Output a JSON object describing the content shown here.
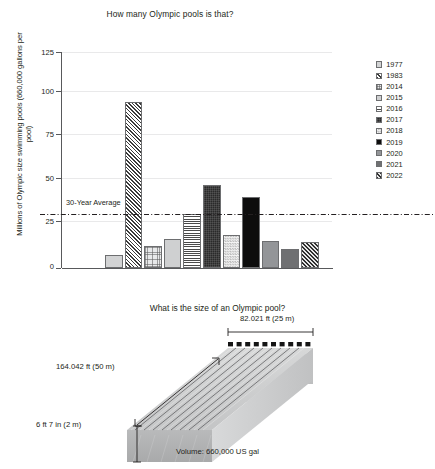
{
  "chart_data": {
    "type": "bar",
    "title": "How many Olympic pools is that?",
    "xlabel": "",
    "ylabel": "Millions of Olympic size swimming pools (660,000 gallons per pool)",
    "ylim": [
      0,
      125
    ],
    "yticks": [
      0,
      25,
      50,
      75,
      100,
      125
    ],
    "grid": true,
    "legend_position": "right",
    "categories": [
      "1977",
      "1983",
      "2014",
      "2015",
      "2016",
      "2017",
      "2018",
      "2019",
      "2020",
      "2021",
      "2022"
    ],
    "values": [
      7.5,
      96,
      13,
      17,
      31,
      48,
      19,
      41,
      15.5,
      11,
      15
    ],
    "series": [
      {
        "name": "Millions of Olympic size swimming pools",
        "values": [
          7.5,
          96,
          13,
          17,
          31,
          48,
          19,
          41,
          15.5,
          11,
          15
        ]
      }
    ],
    "bar_styles": [
      "fill-plain-light",
      "fill-diag-dense",
      "fill-grid-lt",
      "fill-speckle",
      "fill-solid-lt",
      "fill-horiz",
      "fill-dark-tex",
      "fill-check",
      "fill-black",
      "fill-gray-mid",
      "fill-gray-dark",
      "fill-diag-dark"
    ],
    "annotations": [
      {
        "name": "30-year-average-line",
        "label": "30-Year Average",
        "value": 31
      }
    ]
  },
  "chart": {
    "title": "How many Olympic pools is that?",
    "y_axis_title": "Millions of Olympic size swimming pools (660,000 gallons per pool)",
    "y_ticks": [
      "125",
      "100",
      "75",
      "50",
      "25",
      "0"
    ],
    "average_label": "30-Year Average",
    "bars": [
      {
        "year": "1977",
        "value": 7.5,
        "style": "fill-plain-light"
      },
      {
        "year": "1983",
        "value": 96,
        "style": "fill-diag-dense"
      },
      {
        "year": "2014",
        "value": 13,
        "style": "fill-grid-lt"
      },
      {
        "year": "2015",
        "value": 17,
        "style": "fill-solid-lt"
      },
      {
        "year": "2016",
        "value": 31,
        "style": "fill-horiz"
      },
      {
        "year": "2017",
        "value": 48,
        "style": "fill-dark-tex"
      },
      {
        "year": "2018",
        "value": 19,
        "style": "fill-check"
      },
      {
        "year": "2019",
        "value": 41,
        "style": "fill-black"
      },
      {
        "year": "2020",
        "value": 15.5,
        "style": "fill-gray-mid"
      },
      {
        "year": "2021",
        "value": 11,
        "style": "fill-gray-dark"
      },
      {
        "year": "2022",
        "value": 15,
        "style": "fill-diag-dark"
      }
    ],
    "legend": [
      {
        "label": "1977",
        "style": "fill-plain-light"
      },
      {
        "label": "1983",
        "style": "fill-diag-dense"
      },
      {
        "label": "2014",
        "style": "fill-grid-lt"
      },
      {
        "label": "2015",
        "style": "fill-solid-lt"
      },
      {
        "label": "2016",
        "style": "fill-horiz"
      },
      {
        "label": "2017",
        "style": "fill-dark-tex"
      },
      {
        "label": "2018",
        "style": "fill-check"
      },
      {
        "label": "2019",
        "style": "fill-black"
      },
      {
        "label": "2020",
        "style": "fill-gray-mid"
      },
      {
        "label": "2021",
        "style": "fill-gray-dark"
      },
      {
        "label": "2022",
        "style": "fill-diag-dark"
      }
    ]
  },
  "pool": {
    "title": "What is the size of an Olympic pool?",
    "width_label": "82.021 ft  (25 m)",
    "length_label": "164.042 ft (50 m)",
    "depth_label": "6 ft 7 in (2 m)",
    "volume_label": "Volume: 660,000 US gal"
  },
  "colors": {
    "text": "#231f20",
    "axis": "#58595b",
    "gridline": "#e9e9ea",
    "pool_top": "#d5d6d7",
    "pool_front": "#c7c8c9",
    "pool_side": "#b9babb"
  }
}
